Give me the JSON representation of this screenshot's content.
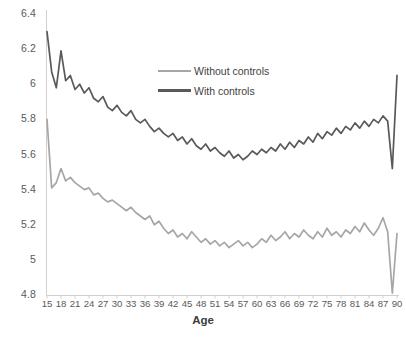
{
  "chart_data": {
    "type": "line",
    "title": "",
    "xlabel": "Age",
    "ylabel": "",
    "xlim": [
      15,
      90
    ],
    "ylim": [
      4.8,
      6.4
    ],
    "grid": false,
    "legend_position": "upper-center",
    "xticks": [
      15,
      18,
      21,
      24,
      27,
      30,
      33,
      36,
      39,
      42,
      45,
      48,
      51,
      54,
      57,
      60,
      63,
      66,
      69,
      72,
      75,
      78,
      81,
      84,
      87,
      90
    ],
    "yticks": [
      "4.8",
      "5",
      "5.2",
      "5.4",
      "5.6",
      "5.8",
      "6",
      "6.2",
      "6.4"
    ],
    "x": [
      15,
      16,
      17,
      18,
      19,
      20,
      21,
      22,
      23,
      24,
      25,
      26,
      27,
      28,
      29,
      30,
      31,
      32,
      33,
      34,
      35,
      36,
      37,
      38,
      39,
      40,
      41,
      42,
      43,
      44,
      45,
      46,
      47,
      48,
      49,
      50,
      51,
      52,
      53,
      54,
      55,
      56,
      57,
      58,
      59,
      60,
      61,
      62,
      63,
      64,
      65,
      66,
      67,
      68,
      69,
      70,
      71,
      72,
      73,
      74,
      75,
      76,
      77,
      78,
      79,
      80,
      81,
      82,
      83,
      84,
      85,
      86,
      87,
      88,
      89,
      90
    ],
    "series": [
      {
        "name": "Without controls",
        "color": "#a6a6a6",
        "values": [
          5.8,
          5.41,
          5.44,
          5.52,
          5.45,
          5.47,
          5.44,
          5.42,
          5.4,
          5.41,
          5.37,
          5.38,
          5.35,
          5.33,
          5.34,
          5.32,
          5.3,
          5.28,
          5.3,
          5.27,
          5.25,
          5.23,
          5.25,
          5.2,
          5.22,
          5.18,
          5.15,
          5.17,
          5.13,
          5.15,
          5.12,
          5.16,
          5.13,
          5.1,
          5.12,
          5.09,
          5.11,
          5.08,
          5.1,
          5.07,
          5.09,
          5.11,
          5.08,
          5.1,
          5.07,
          5.09,
          5.12,
          5.1,
          5.14,
          5.11,
          5.13,
          5.16,
          5.12,
          5.15,
          5.13,
          5.17,
          5.14,
          5.12,
          5.16,
          5.13,
          5.18,
          5.14,
          5.16,
          5.13,
          5.17,
          5.15,
          5.19,
          5.16,
          5.21,
          5.17,
          5.14,
          5.18,
          5.24,
          5.16,
          4.81,
          5.15
        ]
      },
      {
        "name": "With controls",
        "color": "#595959",
        "values": [
          6.3,
          6.07,
          5.98,
          6.19,
          6.02,
          6.05,
          5.97,
          6.0,
          5.95,
          5.98,
          5.92,
          5.9,
          5.93,
          5.87,
          5.85,
          5.88,
          5.84,
          5.82,
          5.85,
          5.8,
          5.78,
          5.8,
          5.76,
          5.73,
          5.75,
          5.72,
          5.7,
          5.72,
          5.68,
          5.7,
          5.66,
          5.69,
          5.65,
          5.63,
          5.66,
          5.62,
          5.64,
          5.61,
          5.59,
          5.62,
          5.58,
          5.6,
          5.57,
          5.59,
          5.62,
          5.6,
          5.63,
          5.61,
          5.64,
          5.62,
          5.66,
          5.63,
          5.67,
          5.64,
          5.68,
          5.66,
          5.7,
          5.67,
          5.72,
          5.69,
          5.73,
          5.71,
          5.75,
          5.72,
          5.76,
          5.74,
          5.78,
          5.75,
          5.79,
          5.76,
          5.8,
          5.78,
          5.82,
          5.79,
          5.52,
          6.05
        ]
      }
    ]
  },
  "legend": {
    "items": [
      {
        "label": "Without controls"
      },
      {
        "label": "With controls"
      }
    ]
  },
  "axis": {
    "x_title": "Age"
  }
}
